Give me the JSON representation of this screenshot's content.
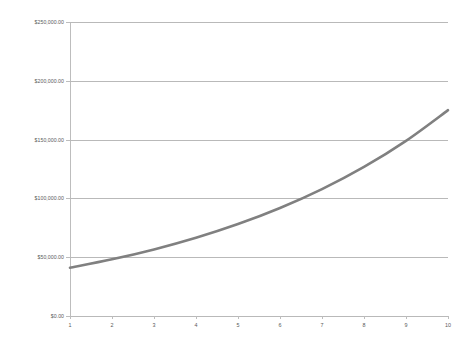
{
  "chart_data": {
    "type": "line",
    "title": "",
    "subtitle": "",
    "xlabel": "",
    "ylabel": "",
    "categories": [
      "1",
      "2",
      "3",
      "4",
      "5",
      "6",
      "7",
      "8",
      "9",
      "10"
    ],
    "x": [
      1,
      2,
      3,
      4,
      5,
      6,
      7,
      8,
      9,
      10
    ],
    "values": [
      41000.0,
      48175.0,
      56605.0,
      66511.0,
      78150.0,
      91826.0,
      107896.0,
      126777.0,
      148963.0,
      175032.0
    ],
    "series": [
      {
        "name": "Value",
        "color": "#808080",
        "values": [
          41000.0,
          48175.0,
          56605.0,
          66511.0,
          78150.0,
          91826.0,
          107896.0,
          126777.0,
          148963.0,
          175032.0
        ]
      }
    ],
    "ylim": [
      0,
      250000
    ],
    "xlim": [
      1,
      10
    ],
    "ytick_values": [
      0,
      50000,
      100000,
      150000,
      200000,
      250000
    ],
    "ytick_labels": [
      "$0.00",
      "$50,000.00",
      "$100,000.00",
      "$150,000.00",
      "$200,000.00",
      "$250,000.00"
    ],
    "xtick_labels": [
      "1",
      "2",
      "3",
      "4",
      "5",
      "6",
      "7",
      "8",
      "9",
      "10"
    ],
    "grid": "horizontal",
    "legend": "none",
    "line_color": "#808080",
    "grid_color": "#b9b9b9",
    "axis_color": "#bdbdbd",
    "tick_text_color": "#5a5a5a",
    "background": "#ffffff",
    "line_width": 2.6,
    "markers": "none",
    "annotations": []
  }
}
